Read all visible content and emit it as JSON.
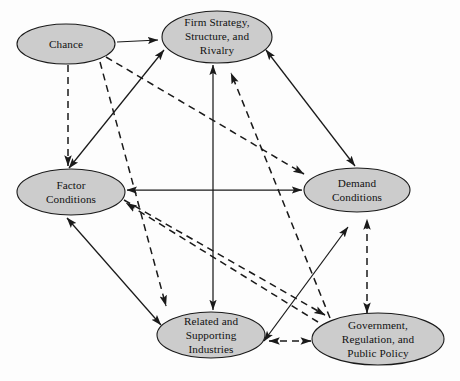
{
  "diagram": {
    "background_color": "#fdfdfd",
    "node_fill_color": "#cccccc",
    "node_stroke_color": "#1a1a1a",
    "edge_color": "#1a1a1a",
    "nodes": [
      {
        "id": "chance",
        "lines": [
          "Chance"
        ],
        "cx": 66,
        "cy": 44,
        "rx": 49,
        "ry": 20
      },
      {
        "id": "firm-strategy",
        "lines": [
          "Firm Strategy,",
          "Structure, and",
          "Rivalry"
        ],
        "cx": 217,
        "cy": 37,
        "rx": 55,
        "ry": 26
      },
      {
        "id": "factor-conditions",
        "lines": [
          "Factor",
          "Conditions"
        ],
        "cx": 71,
        "cy": 192,
        "rx": 54,
        "ry": 23
      },
      {
        "id": "demand-conditions",
        "lines": [
          "Demand",
          "Conditions"
        ],
        "cx": 357,
        "cy": 190,
        "rx": 53,
        "ry": 22
      },
      {
        "id": "related-supporting-industries",
        "lines": [
          "Related and",
          "Supporting",
          "Industries"
        ],
        "cx": 211,
        "cy": 335,
        "rx": 54,
        "ry": 23
      },
      {
        "id": "government-regulation-public-policy",
        "lines": [
          "Government,",
          "Regulation, and",
          "Public Policy"
        ],
        "cx": 378,
        "cy": 339,
        "rx": 66,
        "ry": 26
      }
    ],
    "edges": [
      {
        "id": "chance-to-firm-strategy",
        "style": "solid",
        "arrows": "end",
        "from": "chance",
        "to": "firm-strategy"
      },
      {
        "id": "chance-to-factor-conditions",
        "style": "dashed",
        "arrows": "end",
        "from": "chance",
        "to": "factor-conditions"
      },
      {
        "id": "chance-to-related-industries",
        "style": "dashed",
        "arrows": "end",
        "from": "chance",
        "to": "related-supporting-industries"
      },
      {
        "id": "chance-to-demand-conditions",
        "style": "dashed",
        "arrows": "end",
        "from": "chance",
        "to": "demand-conditions"
      },
      {
        "id": "factor-conditions-firm-strategy",
        "style": "solid",
        "arrows": "both",
        "from": "factor-conditions",
        "to": "firm-strategy"
      },
      {
        "id": "firm-strategy-demand-conditions",
        "style": "solid",
        "arrows": "both",
        "from": "firm-strategy",
        "to": "demand-conditions"
      },
      {
        "id": "factor-conditions-demand-conditions",
        "style": "solid",
        "arrows": "both",
        "from": "factor-conditions",
        "to": "demand-conditions"
      },
      {
        "id": "firm-strategy-related-industries",
        "style": "solid",
        "arrows": "both",
        "from": "firm-strategy",
        "to": "related-supporting-industries"
      },
      {
        "id": "factor-conditions-related-industries",
        "style": "solid",
        "arrows": "both",
        "from": "factor-conditions",
        "to": "related-supporting-industries"
      },
      {
        "id": "related-industries-demand-conditions",
        "style": "solid",
        "arrows": "both",
        "from": "related-supporting-industries",
        "to": "demand-conditions"
      },
      {
        "id": "government-to-firm-strategy",
        "style": "dashed",
        "arrows": "end",
        "from": "government-regulation-public-policy",
        "to": "firm-strategy"
      },
      {
        "id": "government-to-factor-conditions",
        "style": "dashed",
        "arrows": "end",
        "from": "government-regulation-public-policy",
        "to": "factor-conditions"
      },
      {
        "id": "government-demand-conditions",
        "style": "dashed",
        "arrows": "both",
        "from": "government-regulation-public-policy",
        "to": "demand-conditions"
      },
      {
        "id": "government-related-industries",
        "style": "dashed",
        "arrows": "both",
        "from": "government-regulation-public-policy",
        "to": "related-supporting-industries"
      },
      {
        "id": "factor-conditions-to-government",
        "style": "dashed",
        "arrows": "end",
        "from": "factor-conditions",
        "to": "government-regulation-public-policy"
      }
    ]
  }
}
